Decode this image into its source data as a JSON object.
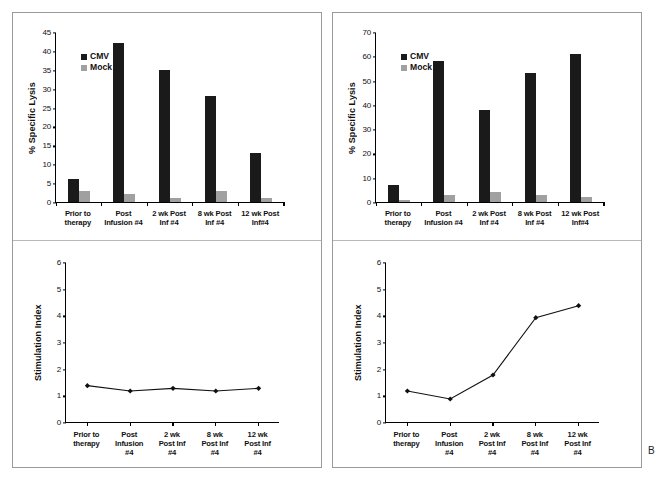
{
  "figure": {
    "panel_letter": "B",
    "background": "#ffffff",
    "series_colors": {
      "cmv": "#1a1a1a",
      "mock": "#a0a0a0"
    }
  },
  "legend": {
    "cmv": "CMV",
    "mock": "Mock"
  },
  "chart_data": [
    {
      "id": "top-left-bar",
      "type": "bar",
      "title": "",
      "xlabel": "",
      "ylabel": "% Specific Lysis",
      "ylim": [
        0,
        45
      ],
      "yticks": [
        0,
        5,
        10,
        15,
        20,
        25,
        30,
        35,
        40,
        45
      ],
      "grid": false,
      "legend_position": "top-left",
      "categories": [
        "Prior to\ntherapy",
        "Post\nInfusion #4",
        "2 wk Post\nInf #4",
        "8 wk Post\nInf #4",
        "12 wk Post\nInf#4"
      ],
      "series": [
        {
          "name": "CMV",
          "values": [
            6,
            42,
            35,
            28,
            13
          ]
        },
        {
          "name": "Mock",
          "values": [
            3,
            2,
            1,
            3,
            1
          ]
        }
      ]
    },
    {
      "id": "top-right-bar",
      "type": "bar",
      "title": "",
      "xlabel": "",
      "ylabel": "% Specific Lysis",
      "ylim": [
        0,
        70
      ],
      "yticks": [
        0,
        10,
        20,
        30,
        40,
        50,
        60,
        70
      ],
      "grid": false,
      "legend_position": "top-left",
      "categories": [
        "Prior to\ntherapy",
        "Post\nInfusion #4",
        "2 wk Post\nInf #4",
        "8 wk Post\nInf #4",
        "12 wk Post\nInf#4"
      ],
      "series": [
        {
          "name": "CMV",
          "values": [
            7,
            58,
            38,
            53,
            61
          ]
        },
        {
          "name": "Mock",
          "values": [
            1,
            3,
            4,
            3,
            2
          ]
        }
      ]
    },
    {
      "id": "bottom-left-line",
      "type": "line",
      "title": "",
      "xlabel": "",
      "ylabel": "Stimulation Index",
      "ylim": [
        0,
        6
      ],
      "yticks": [
        0,
        1,
        2,
        3,
        4,
        5,
        6
      ],
      "grid": false,
      "categories": [
        "Prior to\ntherapy",
        "Post\nInfusion\n#4",
        "2 wk\nPost Inf\n#4",
        "8 wk\nPost Inf\n#4",
        "12 wk\nPost Inf\n#4"
      ],
      "series": [
        {
          "name": "Stimulation Index",
          "values": [
            1.4,
            1.2,
            1.3,
            1.2,
            1.3
          ]
        }
      ]
    },
    {
      "id": "bottom-right-line",
      "type": "line",
      "title": "",
      "xlabel": "",
      "ylabel": "Stimulation Index",
      "ylim": [
        0,
        6
      ],
      "yticks": [
        0,
        1,
        2,
        3,
        4,
        5,
        6
      ],
      "grid": false,
      "categories": [
        "Prior to\ntherapy",
        "Post\nInfusion\n#4",
        "2 wk\nPost Inf\n#4",
        "8 wk\nPost Inf\n#4",
        "12 wk\nPost Inf\n#4"
      ],
      "series": [
        {
          "name": "Stimulation Index",
          "values": [
            1.2,
            0.9,
            1.8,
            3.95,
            4.4
          ]
        }
      ]
    }
  ]
}
